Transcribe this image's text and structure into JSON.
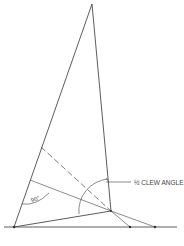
{
  "diagram": {
    "title": "",
    "labels": {
      "half_clew_angle": "½ CLEW ANGLE",
      "right_angle": "90°",
      "footer_mark": ""
    },
    "points": {
      "head": [
        92,
        4
      ],
      "tack": [
        14,
        227
      ],
      "clew": [
        111,
        211
      ],
      "luff_dash_start": [
        41,
        147
      ],
      "luff_perp_start": [
        30,
        180
      ],
      "baseline_point_1": [
        130,
        227
      ],
      "baseline_point_2": [
        155,
        227
      ]
    },
    "baseline": {
      "x_start": 4,
      "x_end": 177,
      "y": 227
    },
    "colors": {
      "line": "#4a4a4a",
      "text": "#444444",
      "background": "#ffffff"
    }
  }
}
